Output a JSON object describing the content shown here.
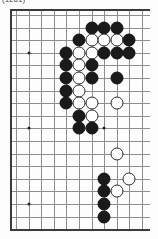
{
  "caption": {
    "text": "(1261)"
  },
  "board": {
    "kind": "go-board-diagram",
    "description": "Partial Go board problem diagram, right-hand section",
    "columns": 11,
    "rows": 19,
    "cell_size": 12.6,
    "origin_x": 6,
    "origin_y": 6,
    "line_color": "#8e8e8e",
    "edge_color": "#3a3a3a",
    "black_color": "#1a1a1a",
    "white_color": "#ffffff",
    "edges": [
      "left",
      "top",
      "bottom"
    ],
    "star_points": [
      {
        "col": 1,
        "row": 3
      },
      {
        "col": 1,
        "row": 9
      },
      {
        "col": 1,
        "row": 15
      },
      {
        "col": 7,
        "row": 9
      }
    ],
    "stones": [
      {
        "color": "black",
        "col": 6,
        "row": 1
      },
      {
        "color": "black",
        "col": 7,
        "row": 1
      },
      {
        "color": "black",
        "col": 8,
        "row": 1
      },
      {
        "color": "black",
        "col": 5,
        "row": 2
      },
      {
        "color": "white",
        "col": 6,
        "row": 2
      },
      {
        "color": "white",
        "col": 7,
        "row": 2
      },
      {
        "color": "white",
        "col": 8,
        "row": 2
      },
      {
        "color": "black",
        "col": 9,
        "row": 2
      },
      {
        "color": "black",
        "col": 4,
        "row": 3
      },
      {
        "color": "white",
        "col": 5,
        "row": 3
      },
      {
        "color": "white",
        "col": 6,
        "row": 3
      },
      {
        "color": "black",
        "col": 7,
        "row": 3
      },
      {
        "color": "black",
        "col": 8,
        "row": 3
      },
      {
        "color": "black",
        "col": 9,
        "row": 3
      },
      {
        "color": "black",
        "col": 4,
        "row": 4
      },
      {
        "color": "white",
        "col": 5,
        "row": 4
      },
      {
        "color": "black",
        "col": 6,
        "row": 4
      },
      {
        "color": "black",
        "col": 4,
        "row": 5
      },
      {
        "color": "white",
        "col": 5,
        "row": 5
      },
      {
        "color": "black",
        "col": 6,
        "row": 5
      },
      {
        "color": "black",
        "col": 8,
        "row": 5
      },
      {
        "color": "black",
        "col": 4,
        "row": 6
      },
      {
        "color": "white",
        "col": 5,
        "row": 6
      },
      {
        "color": "black",
        "col": 4,
        "row": 7
      },
      {
        "color": "white",
        "col": 5,
        "row": 7
      },
      {
        "color": "white",
        "col": 6,
        "row": 7
      },
      {
        "color": "white",
        "col": 8,
        "row": 7
      },
      {
        "color": "black",
        "col": 5,
        "row": 8
      },
      {
        "color": "white",
        "col": 6,
        "row": 8
      },
      {
        "color": "black",
        "col": 5,
        "row": 9
      },
      {
        "color": "black",
        "col": 6,
        "row": 9
      },
      {
        "color": "white",
        "col": 8,
        "row": 11
      },
      {
        "color": "black",
        "col": 7,
        "row": 13
      },
      {
        "color": "white",
        "col": 9,
        "row": 13
      },
      {
        "color": "black",
        "col": 7,
        "row": 14
      },
      {
        "color": "white",
        "col": 8,
        "row": 14
      },
      {
        "color": "black",
        "col": 7,
        "row": 15
      },
      {
        "color": "black",
        "col": 7,
        "row": 16
      }
    ]
  }
}
